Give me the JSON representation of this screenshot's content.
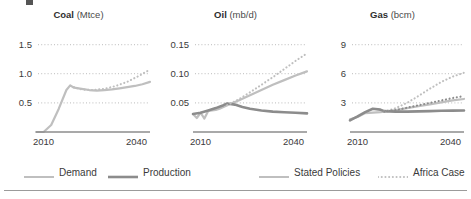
{
  "figure": {
    "background": "#ffffff",
    "colors": {
      "demand": "#bfbfbf",
      "production": "#8c8c8c",
      "stated_policies": "#bfbfbf",
      "africa_case": "#bfbfbf",
      "gridline": "#c9c9c9",
      "axis": "#8c8c8c",
      "text": "#3a3a3a"
    }
  },
  "legend": {
    "position": "bottom",
    "items": [
      {
        "label": "Demand",
        "style": "solid",
        "color": "#bfbfbf",
        "width": 2
      },
      {
        "label": "Production",
        "style": "solid",
        "color": "#8c8c8c",
        "width": 2.6
      },
      {
        "label": "Stated Policies",
        "style": "solid",
        "color": "#bfbfbf",
        "width": 2
      },
      {
        "label": "Africa Case",
        "style": "dotted",
        "color": "#bfbfbf",
        "width": 2
      }
    ]
  },
  "chart_data": [
    {
      "type": "line",
      "title": "Coal (Mtce)",
      "title_name": "Coal",
      "title_unit": "(Mtce)",
      "xlabel": "",
      "ylabel": "Mtce",
      "xlim": [
        2010,
        2040
      ],
      "ylim": [
        0,
        1.75
      ],
      "xticks": [
        2010,
        2040
      ],
      "xticklabels": [
        "2010",
        "2040"
      ],
      "yticks": [
        0.5,
        1.0,
        1.5
      ],
      "yticklabels": [
        "0.5",
        "1.0",
        "1.5"
      ],
      "grid": true,
      "series": [
        {
          "name": "Demand",
          "style": "solid",
          "color": "#bfbfbf",
          "x": [
            2010,
            2012,
            2014,
            2016,
            2018,
            2019,
            2020,
            2022,
            2024,
            2026,
            2028,
            2030,
            2032,
            2034,
            2036,
            2038,
            2040
          ],
          "y": [
            0.0,
            0.0,
            0.12,
            0.4,
            0.72,
            0.8,
            0.76,
            0.74,
            0.72,
            0.71,
            0.72,
            0.73,
            0.75,
            0.77,
            0.79,
            0.82,
            0.86
          ]
        },
        {
          "name": "Africa Case",
          "style": "dotted",
          "color": "#bfbfbf",
          "x": [
            2019,
            2022,
            2025,
            2028,
            2031,
            2034,
            2037,
            2040
          ],
          "y": [
            0.79,
            0.73,
            0.72,
            0.74,
            0.79,
            0.86,
            0.96,
            1.07
          ]
        }
      ]
    },
    {
      "type": "line",
      "title": "Oil (mb/d)",
      "title_name": "Oil",
      "title_unit": "(mb/d)",
      "xlabel": "",
      "ylabel": "mb/d",
      "xlim": [
        2010,
        2040
      ],
      "ylim": [
        0,
        0.175
      ],
      "xticks": [
        2010,
        2040
      ],
      "xticklabels": [
        "2010",
        "2040"
      ],
      "yticks": [
        0.05,
        0.1,
        0.15
      ],
      "yticklabels": [
        "0.05",
        "0.10",
        "0.15"
      ],
      "grid": true,
      "series": [
        {
          "name": "Demand",
          "style": "solid",
          "color": "#bfbfbf",
          "x": [
            2010,
            2011,
            2012,
            2013,
            2014,
            2015,
            2016,
            2017,
            2018,
            2019,
            2022,
            2025,
            2028,
            2031,
            2034,
            2037,
            2040
          ],
          "y": [
            0.031,
            0.024,
            0.033,
            0.023,
            0.036,
            0.037,
            0.038,
            0.04,
            0.043,
            0.046,
            0.054,
            0.063,
            0.072,
            0.081,
            0.089,
            0.097,
            0.104
          ]
        },
        {
          "name": "Production",
          "style": "solid",
          "color": "#8c8c8c",
          "x": [
            2010,
            2012,
            2014,
            2016,
            2018,
            2019,
            2021,
            2023,
            2025,
            2028,
            2031,
            2034,
            2037,
            2040
          ],
          "y": [
            0.031,
            0.033,
            0.037,
            0.041,
            0.046,
            0.049,
            0.047,
            0.043,
            0.04,
            0.037,
            0.035,
            0.034,
            0.033,
            0.032
          ]
        },
        {
          "name": "Africa Case",
          "style": "dotted",
          "color": "#bfbfbf",
          "x": [
            2019,
            2022,
            2025,
            2028,
            2031,
            2034,
            2037,
            2040
          ],
          "y": [
            0.046,
            0.056,
            0.068,
            0.081,
            0.094,
            0.108,
            0.122,
            0.135
          ]
        }
      ]
    },
    {
      "type": "line",
      "title": "Gas (bcm)",
      "title_name": "Gas",
      "title_unit": "(bcm)",
      "xlabel": "",
      "ylabel": "bcm",
      "xlim": [
        2010,
        2040
      ],
      "ylim": [
        0,
        10.5
      ],
      "xticks": [
        2010,
        2040
      ],
      "xticklabels": [
        "2010",
        "2040"
      ],
      "yticks": [
        3,
        6,
        9
      ],
      "yticklabels": [
        "3",
        "6",
        "9"
      ],
      "grid": true,
      "series": [
        {
          "name": "Demand",
          "style": "solid",
          "color": "#bfbfbf",
          "x": [
            2010,
            2012,
            2014,
            2016,
            2018,
            2019,
            2022,
            2025,
            2028,
            2031,
            2034,
            2037,
            2040
          ],
          "y": [
            1.3,
            1.55,
            1.95,
            2.0,
            2.05,
            2.1,
            2.25,
            2.45,
            2.65,
            2.85,
            3.05,
            3.25,
            3.4
          ]
        },
        {
          "name": "Production",
          "style": "solid",
          "color": "#8c8c8c",
          "x": [
            2010,
            2012,
            2014,
            2016,
            2018,
            2019,
            2022,
            2025,
            2028,
            2031,
            2034,
            2037,
            2040
          ],
          "y": [
            1.2,
            1.6,
            2.05,
            2.4,
            2.3,
            2.15,
            2.1,
            2.1,
            2.12,
            2.15,
            2.18,
            2.2,
            2.22
          ]
        },
        {
          "name": "Africa Case",
          "style": "dotted",
          "color": "#bfbfbf",
          "x": [
            2019,
            2022,
            2025,
            2028,
            2031,
            2034,
            2037,
            2040
          ],
          "y": [
            2.1,
            2.45,
            3.0,
            3.7,
            4.45,
            5.15,
            5.7,
            6.1
          ]
        },
        {
          "name": "Africa Case 2",
          "style": "dotted",
          "color": "#8c8c8c",
          "x": [
            2019,
            2022,
            2025,
            2028,
            2031,
            2034,
            2037,
            2040
          ],
          "y": [
            2.1,
            2.25,
            2.5,
            2.75,
            3.0,
            3.25,
            3.5,
            3.7
          ]
        }
      ]
    }
  ]
}
